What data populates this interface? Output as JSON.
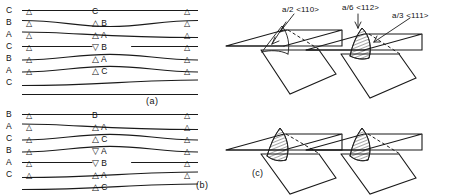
{
  "figure": {
    "panel_tags": {
      "a": "(a)",
      "b": "(b)",
      "c": "(c)"
    }
  },
  "panel_a": {
    "tag": "(a)",
    "edge_labels": [
      "C",
      "B",
      "A",
      "C",
      "B",
      "A",
      "C"
    ],
    "mid_labels": [
      "C",
      "B",
      "A",
      "B",
      "A",
      "C"
    ],
    "mid_markers": [
      "none",
      "up",
      "up",
      "down",
      "up",
      "up"
    ],
    "left_markers": [
      "up",
      "up",
      "up",
      "up",
      "up",
      "up"
    ],
    "right_markers": [
      "up",
      "up",
      "up",
      "up",
      "up",
      "up"
    ],
    "line_count": 8
  },
  "panel_b": {
    "tag": "(b)",
    "edge_labels": [
      "B",
      "A",
      "C",
      "B",
      "A",
      "C"
    ],
    "mid_labels": [
      "B",
      "A",
      "C",
      "A",
      "B",
      "A",
      "C"
    ],
    "mid_markers": [
      "none",
      "up",
      "up",
      "down",
      "down",
      "up",
      "up"
    ],
    "left_markers": [
      "up",
      "up",
      "up",
      "up",
      "up",
      "up"
    ],
    "right_markers": [
      "up",
      "up",
      "up",
      "up",
      "up",
      "up"
    ],
    "line_count": 8
  },
  "panel_c": {
    "tag": "(c)",
    "annotations": [
      {
        "id": "burgers-perfect",
        "text": "a/2 <110>"
      },
      {
        "id": "burgers-shockley",
        "text": "a/6 <112>"
      },
      {
        "id": "burgers-frank",
        "text": "a/3 <111>"
      }
    ],
    "diagrams": [
      {
        "id": "diagram-1",
        "label": "a/2 <110>",
        "hatched": false
      },
      {
        "id": "diagram-2",
        "label": "a/6 <112> / a/3 <111>",
        "hatched": true
      },
      {
        "id": "diagram-3",
        "label": "",
        "hatched": true
      },
      {
        "id": "diagram-4",
        "label": "",
        "hatched": true
      }
    ]
  },
  "glyphs": {
    "triangle_up": "△",
    "triangle_down": "▽"
  },
  "colors": {
    "ink": "#1a1a1a",
    "background": "#ffffff"
  }
}
